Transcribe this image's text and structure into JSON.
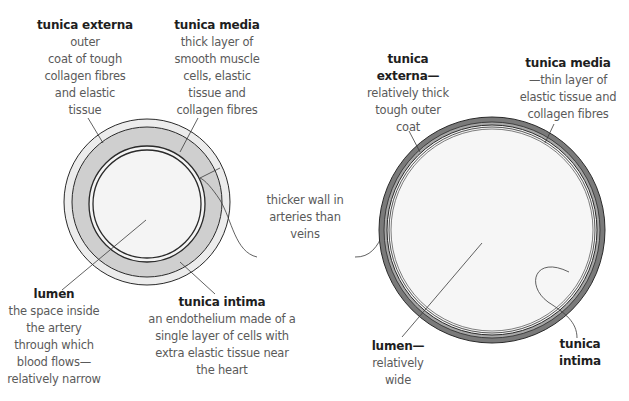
{
  "colors": {
    "artery_externa": "#ececec",
    "artery_media": "#cfcfcf",
    "artery_lumen": "#f4f4f4",
    "vein_externa": "#7a7a7a",
    "vein_media": "#a8a8a8",
    "vein_lumen": "#f6f6f6",
    "outline": "#2a2a2a",
    "title_text": "#1e1e1e",
    "body_text": "#5a5a5a"
  },
  "artery": {
    "externa": {
      "title": "tunica externa",
      "lines": [
        "outer",
        "coat of tough",
        "collagen fibres",
        "and elastic",
        "tissue"
      ]
    },
    "media": {
      "title": "tunica media",
      "lines": [
        "thick layer of",
        "smooth muscle",
        "cells, elastic",
        "tissue and",
        "collagen fibres"
      ]
    },
    "lumen": {
      "title": "lumen",
      "lines": [
        "the space inside",
        "the artery",
        "through which",
        "blood flows—",
        "relatively narrow"
      ]
    },
    "intima": {
      "title": "tunica intima",
      "lines": [
        "an endothelium made of a",
        "single layer of cells with",
        "extra elastic tissue near",
        "the heart"
      ]
    }
  },
  "center_label": {
    "lines": [
      "thicker wall in",
      "arteries than",
      "veins"
    ]
  },
  "vein": {
    "externa": {
      "title_lines": [
        "tunica",
        "externa—"
      ],
      "lines": [
        "relatively thick",
        "tough outer",
        "coat"
      ]
    },
    "media": {
      "title": "tunica media",
      "lines": [
        "—thin layer of",
        "elastic tissue and",
        "collagen fibres"
      ]
    },
    "lumen": {
      "title": "lumen—",
      "lines": [
        "relatively",
        "wide"
      ]
    },
    "intima": {
      "title_lines": [
        "tunica",
        "intima"
      ]
    }
  }
}
